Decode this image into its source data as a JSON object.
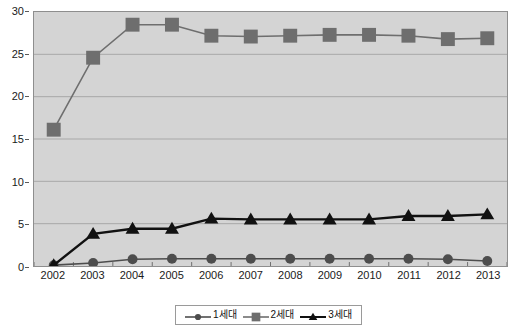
{
  "chart_data": {
    "type": "line",
    "title": "",
    "subtitle": "",
    "xlabel": "",
    "ylabel": "",
    "categories": [
      "2002",
      "2003",
      "2004",
      "2005",
      "2006",
      "2007",
      "2008",
      "2009",
      "2010",
      "2011",
      "2012",
      "2013"
    ],
    "series": [
      {
        "name": "1세대",
        "marker": "circle",
        "color": "#4d4d4d",
        "values": [
          0.1,
          0.35,
          0.8,
          0.85,
          0.85,
          0.85,
          0.85,
          0.85,
          0.85,
          0.85,
          0.8,
          0.6
        ]
      },
      {
        "name": "2세대",
        "marker": "square",
        "color": "#6e6e6e",
        "values": [
          16.1,
          24.6,
          28.5,
          28.5,
          27.2,
          27.1,
          27.2,
          27.3,
          27.3,
          27.2,
          26.8,
          26.9
        ]
      },
      {
        "name": "3세대",
        "marker": "triangle",
        "color": "#111111",
        "values": [
          0.1,
          3.8,
          4.4,
          4.4,
          5.6,
          5.5,
          5.5,
          5.5,
          5.5,
          5.9,
          5.9,
          6.1
        ]
      }
    ],
    "ylim": [
      0,
      30
    ],
    "yticks": [
      0,
      5,
      10,
      15,
      20,
      25,
      30
    ],
    "ytick_labels": [
      "0",
      "5",
      "10",
      "15",
      "20",
      "25",
      "30"
    ],
    "grid": true,
    "grid_axis": "y",
    "legend_position": "bottom",
    "plot_background": "#d4d4d4"
  },
  "legend": {
    "entries": [
      {
        "label": "1세대"
      },
      {
        "label": "2세대"
      },
      {
        "label": "3세대"
      }
    ]
  },
  "colors": {
    "plot_bg": "#d4d4d4",
    "grid": "#a8a8a8",
    "axis": "#6f6f6f",
    "series1": "#4d4d4d",
    "series2": "#6e6e6e",
    "series3": "#111111",
    "text": "#1a1a1a"
  }
}
